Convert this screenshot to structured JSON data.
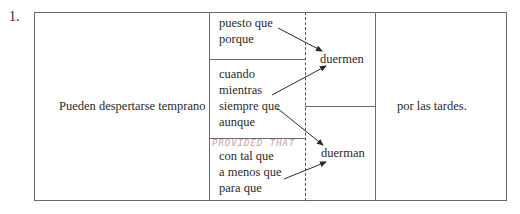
{
  "exercise": {
    "number": "1.",
    "subject_clause": "Pueden despertarse temprano",
    "conjunctions_group_1": [
      "puesto que",
      "porque"
    ],
    "conjunctions_group_2": [
      "cuando",
      "mientras",
      "siempre que",
      "aunque"
    ],
    "conjunctions_group_3": [
      "con tal que",
      "a menos que",
      "para que"
    ],
    "verb_indicative": "duermen",
    "verb_subjunctive": "duerman",
    "ending": "por las tardes.",
    "handwritten_note": "PROVIDED THAT"
  }
}
